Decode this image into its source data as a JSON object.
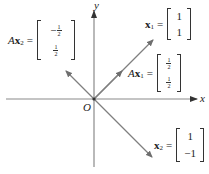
{
  "diagram": {
    "axes": {
      "x_label": "x",
      "y_label": "y",
      "origin_label": "O"
    },
    "vectors": [
      {
        "id": "x1",
        "label_prefix": "",
        "label_var": "x",
        "label_sub": "1",
        "entries": [
          "1",
          "1"
        ],
        "color": "#808080"
      },
      {
        "id": "Ax1",
        "label_prefix": "A",
        "label_var": "x",
        "label_sub": "1",
        "entries": [
          {
            "num": "1",
            "den": "2"
          },
          {
            "num": "1",
            "den": "2"
          }
        ],
        "color": "#808080"
      },
      {
        "id": "x2",
        "label_prefix": "",
        "label_var": "x",
        "label_sub": "2",
        "entries": [
          "1",
          "−1"
        ],
        "color": "#808080"
      },
      {
        "id": "Ax2",
        "label_prefix": "A",
        "label_var": "x",
        "label_sub": "2",
        "entries": [
          {
            "sign": "−",
            "num": "1",
            "den": "2"
          },
          {
            "num": "1",
            "den": "2"
          }
        ],
        "color": "#808080"
      }
    ],
    "equals": "=",
    "colors": {
      "axis": "#8a8a8a",
      "vector": "#7f7f7f",
      "text": "#222222"
    }
  }
}
